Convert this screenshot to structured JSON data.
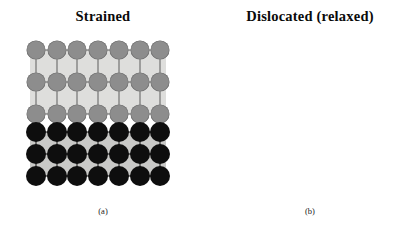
{
  "figure": {
    "type": "scientific-diagram",
    "background_color": "#ffffff"
  },
  "panels": [
    {
      "id": "a",
      "title": "Strained",
      "caption": "(a)",
      "film": {
        "label": "epilayer",
        "atom_color": "#8d8d8d",
        "background_color": "#dededc",
        "rows": 3,
        "columns": 7,
        "column_spacing_px": 22.6,
        "row_spacing_px": 35,
        "atom_diameter_px": 19
      },
      "substrate": {
        "label": "substrate",
        "atom_color": "#0e0e0e",
        "background_color": "#c9c9c7",
        "rows": 3,
        "columns": 7,
        "column_spacing_px": 22.6,
        "row_spacing_px": 22,
        "atom_diameter_px": 20
      }
    },
    {
      "id": "b",
      "title": "Dislocated (relaxed)",
      "caption": "(b)",
      "film": {
        "label": "epilayer",
        "atom_color": "#8d8d8d",
        "background_color": "#dededc",
        "rows": 3,
        "columns": 6,
        "column_spacing_px": 26.5,
        "row_spacing_px": 31,
        "atom_diameter_px": 19
      },
      "substrate": {
        "label": "substrate",
        "atom_color": "#0e0e0e",
        "background_color": "#c9c9c7",
        "rows": 3,
        "columns": 7,
        "column_spacing_px": 22.6,
        "row_spacing_px": 22,
        "atom_diameter_px": 20
      }
    }
  ]
}
